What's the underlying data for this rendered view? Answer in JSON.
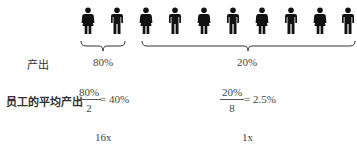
{
  "figures": [
    {
      "type": "female",
      "group": "high"
    },
    {
      "type": "male",
      "group": "high"
    },
    {
      "type": "female",
      "group": "low"
    },
    {
      "type": "male",
      "group": "low"
    },
    {
      "type": "female",
      "group": "low"
    },
    {
      "type": "male",
      "group": "low"
    },
    {
      "type": "female",
      "group": "low"
    },
    {
      "type": "male",
      "group": "low"
    },
    {
      "type": "female",
      "group": "low"
    },
    {
      "type": "male",
      "group": "low"
    }
  ],
  "labels": {
    "output": "产出",
    "avg_output": "员工的平均产出"
  },
  "groups": {
    "high": {
      "share": "80%",
      "numerator": "80%",
      "denominator": "2",
      "result": "= 40%",
      "multiplier": "16x"
    },
    "low": {
      "share": "20%",
      "numerator": "20%",
      "denominator": "8",
      "result": "= 2.5%",
      "multiplier": "1x"
    }
  },
  "icons": {
    "female": "person-female-icon",
    "male": "person-male-icon"
  },
  "colors": {
    "figure": "#111111",
    "brace": "#333333",
    "text": "#444444"
  }
}
